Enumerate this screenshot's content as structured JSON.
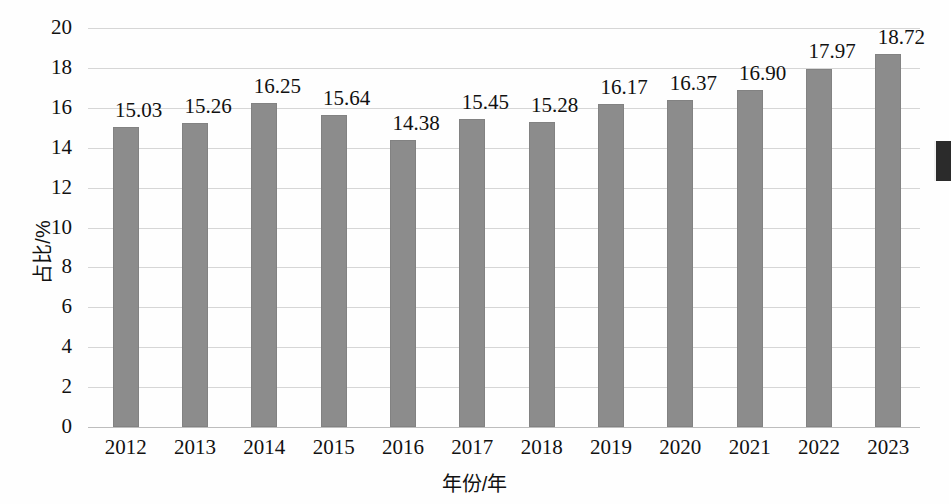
{
  "chart_data": {
    "type": "bar",
    "title": "",
    "xlabel": "年份/年",
    "ylabel": "占比/%",
    "categories": [
      "2012",
      "2013",
      "2014",
      "2015",
      "2016",
      "2017",
      "2018",
      "2019",
      "2020",
      "2021",
      "2022",
      "2023"
    ],
    "values": [
      15.03,
      15.26,
      16.25,
      15.64,
      14.38,
      15.45,
      15.28,
      16.17,
      16.37,
      16.9,
      17.97,
      18.72
    ],
    "value_labels": [
      "15.03",
      "15.26",
      "16.25",
      "15.64",
      "14.38",
      "15.45",
      "15.28",
      "16.17",
      "16.37",
      "16.90",
      "17.97",
      "18.72"
    ],
    "ylim": [
      0,
      20
    ],
    "ytick_step": 2,
    "ytick_labels": [
      "0",
      "2",
      "4",
      "6",
      "8",
      "10",
      "12",
      "14",
      "16",
      "18",
      "20"
    ],
    "grid": true,
    "legend": "none",
    "bar_color": "#8c8c8c",
    "grid_color": "#d6d6d6",
    "background_color": "#fefefe",
    "text_color": "#111111"
  }
}
